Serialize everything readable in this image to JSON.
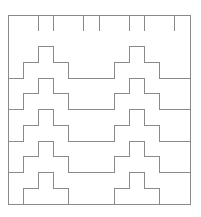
{
  "figure": {
    "stroke_color": "#8a8a8a",
    "background": "#ffffff",
    "frame": {
      "x": 8,
      "y": 15,
      "width": 182,
      "height": 189
    },
    "bands": 6,
    "band_height": 31.5,
    "step_width": 15.17,
    "step_height": 15.75
  }
}
